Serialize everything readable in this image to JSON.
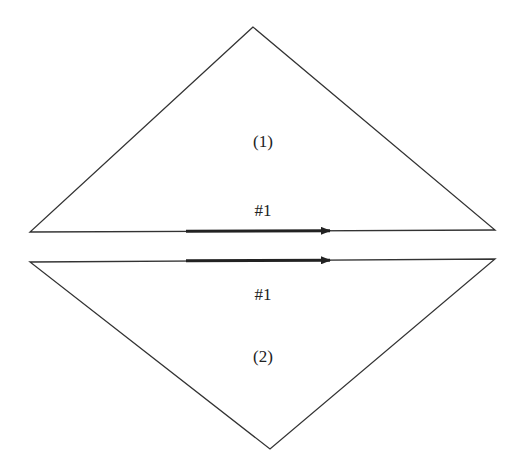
{
  "diagram": {
    "width": 523,
    "height": 467,
    "stroke_color": "#333333",
    "arrow_color": "#222222",
    "triangles": [
      {
        "id": "triangle-1",
        "label": "(1)",
        "edge_label": "#1",
        "vertices": [
          [
            253,
            27
          ],
          [
            30,
            232
          ],
          [
            495,
            230
          ]
        ],
        "label_pos": [
          263,
          141
        ],
        "edge_label_pos": [
          263,
          210
        ]
      },
      {
        "id": "triangle-2",
        "label": "(2)",
        "edge_label": "#1",
        "vertices": [
          [
            30,
            262
          ],
          [
            495,
            259
          ],
          [
            270,
            449
          ]
        ],
        "label_pos": [
          263,
          356
        ],
        "edge_label_pos": [
          263,
          294
        ]
      }
    ],
    "arrows": [
      {
        "id": "arrow-upper",
        "from": [
          186,
          231.3
        ],
        "to": [
          338,
          230.7
        ]
      },
      {
        "id": "arrow-lower",
        "from": [
          186,
          260.8
        ],
        "to": [
          338,
          260.2
        ]
      }
    ]
  }
}
